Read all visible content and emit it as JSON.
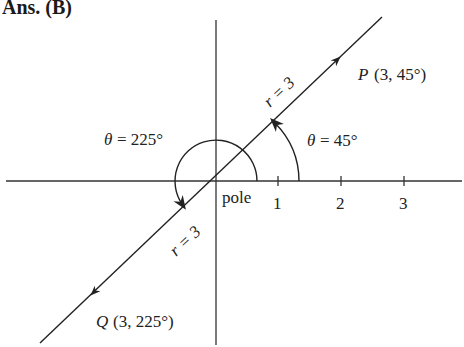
{
  "header": {
    "title": "Ans. (B)"
  },
  "diagram": {
    "type": "polar-coordinates",
    "pole_label": "pole",
    "axis_ticks": [
      "1",
      "2",
      "3"
    ],
    "point_p": {
      "label": "P",
      "coords": "(3, 45°)"
    },
    "point_q": {
      "label": "Q",
      "coords": "(3, 225°)"
    },
    "radius_label_upper": "r = 3",
    "radius_label_lower": "r = 3",
    "angle_p": {
      "symbol": "θ",
      "text": "= 45°"
    },
    "angle_q": {
      "symbol": "θ",
      "text": "= 225°"
    }
  }
}
